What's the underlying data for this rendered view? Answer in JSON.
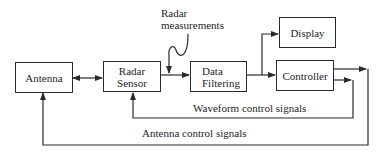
{
  "diagram": {
    "nodes": [
      {
        "id": "antenna",
        "label": "Antenna"
      },
      {
        "id": "radar_sensor",
        "label_line1": "Radar",
        "label_line2": "Sensor"
      },
      {
        "id": "data_filtering",
        "label_line1": "Data",
        "label_line2": "Filtering"
      },
      {
        "id": "display",
        "label": "Display"
      },
      {
        "id": "controller",
        "label": "Controller"
      }
    ],
    "annotations": {
      "radar_measurements_line1": "Radar",
      "radar_measurements_line2": "measurements",
      "waveform_control": "Waveform control signals",
      "antenna_control": "Antenna control signals"
    },
    "edges": [
      {
        "from": "antenna",
        "to": "radar_sensor",
        "type": "bidirectional"
      },
      {
        "from": "radar_sensor",
        "to": "data_filtering"
      },
      {
        "from": "data_filtering",
        "to": "display"
      },
      {
        "from": "data_filtering",
        "to": "controller"
      },
      {
        "from": "controller",
        "to": "radar_sensor",
        "label": "Waveform control signals"
      },
      {
        "from": "controller",
        "to": "antenna",
        "label": "Antenna control signals"
      }
    ],
    "colors": {
      "line": "#2a2a2a",
      "background": "#ffffff"
    }
  }
}
